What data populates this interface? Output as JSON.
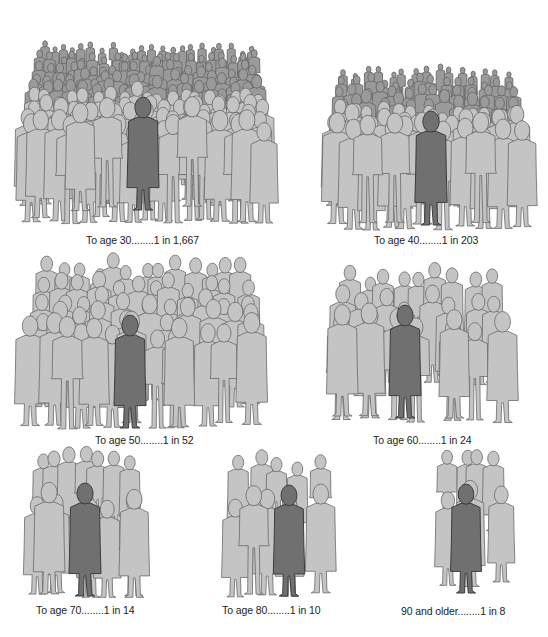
{
  "colors": {
    "background": "#ffffff",
    "crowd_fill": "#c4c4c4",
    "crowd_outline": "#6a6a6a",
    "highlight_fill": "#707070",
    "highlight_outline": "#3c3c3c",
    "dense_fill": "#9a9a9a",
    "caption_text": "#222222"
  },
  "panels": [
    {
      "id": "age30",
      "caption": "To age 30........1 in 1,667",
      "age_label": "To age 30",
      "risk": "1 in 1,667",
      "odds": 1667,
      "box": {
        "x": 12,
        "y": 14,
        "w": 270,
        "h": 210
      },
      "caption_pos": {
        "x": 86,
        "y": 234
      },
      "rows": 9,
      "cols": 22,
      "dense": true,
      "highlight": {
        "x": 143,
        "y": 210,
        "h": 112
      }
    },
    {
      "id": "age40",
      "caption": "To age 40........1 in 203",
      "age_label": "To age 40",
      "risk": "1 in 203",
      "odds": 203,
      "box": {
        "x": 316,
        "y": 45,
        "w": 222,
        "h": 185
      },
      "caption_pos": {
        "x": 374,
        "y": 234
      },
      "rows": 7,
      "cols": 15,
      "dense": true,
      "highlight": {
        "x": 431,
        "y": 225,
        "h": 113
      }
    },
    {
      "id": "age50",
      "caption": "To age 50........1 in 52",
      "age_label": "To age 50",
      "risk": "1 in 52",
      "odds": 52,
      "box": {
        "x": 14,
        "y": 265,
        "w": 262,
        "h": 165
      },
      "caption_pos": {
        "x": 95,
        "y": 434
      },
      "rows": 5,
      "cols": 13,
      "dense": false,
      "highlight": {
        "x": 130,
        "y": 428,
        "h": 112
      }
    },
    {
      "id": "age60",
      "caption": "To age 60........1 in 24",
      "age_label": "To age 60",
      "risk": "1 in 24",
      "odds": 24,
      "box": {
        "x": 318,
        "y": 288,
        "w": 204,
        "h": 138
      },
      "caption_pos": {
        "x": 373,
        "y": 434
      },
      "rows": 3,
      "cols": 9,
      "dense": false,
      "highlight": {
        "x": 405,
        "y": 418,
        "h": 112
      }
    },
    {
      "id": "age70",
      "caption": "To age 70........1 in 14",
      "age_label": "To age 70",
      "risk": "1 in 14",
      "odds": 14,
      "box": {
        "x": 15,
        "y": 477,
        "w": 142,
        "h": 123
      },
      "caption_pos": {
        "x": 36,
        "y": 604
      },
      "rows": 2,
      "cols": 7,
      "dense": false,
      "highlight": {
        "x": 85,
        "y": 596,
        "h": 112
      }
    },
    {
      "id": "age80",
      "caption": "To age 80........1 in 10",
      "age_label": "To age 80",
      "risk": "1 in 10",
      "odds": 10,
      "box": {
        "x": 215,
        "y": 480,
        "w": 130,
        "h": 120
      },
      "caption_pos": {
        "x": 222,
        "y": 604
      },
      "rows": 2,
      "cols": 5,
      "dense": false,
      "highlight": {
        "x": 289,
        "y": 596,
        "h": 110
      }
    },
    {
      "id": "age90",
      "caption": "90 and older........1 in 8",
      "age_label": "90 and older",
      "risk": "1 in 8",
      "odds": 8,
      "box": {
        "x": 425,
        "y": 482,
        "w": 95,
        "h": 105
      },
      "caption_pos": {
        "x": 401,
        "y": 605
      },
      "rows": 2,
      "cols": 4,
      "dense": false,
      "highlight": {
        "x": 466,
        "y": 593,
        "h": 108
      }
    }
  ]
}
